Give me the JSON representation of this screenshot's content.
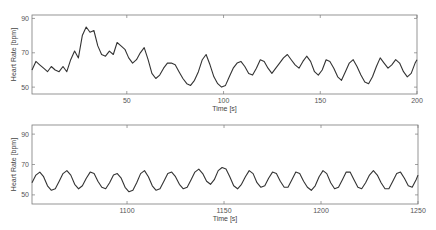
{
  "chart_data": [
    {
      "type": "line",
      "title": "",
      "xlabel": "Time [s]",
      "ylabel": "Heart Rate [bpm]",
      "xlim": [
        1,
        200
      ],
      "ylim": [
        46,
        92
      ],
      "xticks": [
        50,
        100,
        150,
        200
      ],
      "yticks": [
        50,
        70,
        90
      ],
      "grid": false,
      "legend": null,
      "line_color": "#333333",
      "series": [
        {
          "name": "Heart Rate",
          "x": [
            1,
            3,
            5,
            7,
            9,
            11,
            13,
            15,
            17,
            19,
            21,
            23,
            25,
            27,
            29,
            31,
            33,
            35,
            37,
            39,
            41,
            43,
            45,
            47,
            49,
            51,
            53,
            55,
            57,
            59,
            61,
            63,
            65,
            67,
            69,
            71,
            73,
            75,
            77,
            79,
            81,
            83,
            85,
            87,
            89,
            91,
            93,
            95,
            97,
            99,
            101,
            103,
            105,
            107,
            109,
            111,
            113,
            115,
            117,
            119,
            121,
            123,
            125,
            127,
            129,
            131,
            133,
            135,
            137,
            139,
            141,
            143,
            145,
            147,
            149,
            151,
            153,
            155,
            157,
            159,
            161,
            163,
            165,
            167,
            169,
            171,
            173,
            175,
            177,
            179,
            181,
            183,
            185,
            187,
            189,
            191,
            193,
            195,
            197,
            199,
            200
          ],
          "y": [
            60,
            65,
            63,
            61,
            59,
            62,
            60,
            59,
            62,
            59,
            66,
            71,
            67,
            80,
            85,
            82,
            83,
            74,
            69,
            68,
            71,
            69,
            76,
            74,
            72,
            67,
            64,
            66,
            70,
            73,
            66,
            58,
            55,
            57,
            61,
            64,
            64,
            63,
            59,
            55,
            52,
            51,
            54,
            59,
            66,
            69,
            63,
            56,
            52,
            50,
            51,
            56,
            61,
            64,
            65,
            62,
            58,
            57,
            61,
            66,
            65,
            61,
            58,
            61,
            64,
            67,
            69,
            66,
            63,
            61,
            65,
            68,
            65,
            59,
            57,
            60,
            66,
            65,
            61,
            56,
            54,
            59,
            64,
            66,
            62,
            57,
            53,
            52,
            56,
            62,
            67,
            64,
            61,
            63,
            66,
            64,
            59,
            56,
            58,
            64,
            66
          ]
        }
      ]
    },
    {
      "type": "line",
      "title": "",
      "xlabel": "Time [s]",
      "ylabel": "Heart Rate [bpm]",
      "xlim": [
        1051,
        1250
      ],
      "ylim": [
        44,
        96
      ],
      "xticks": [
        1100,
        1150,
        1200,
        1250
      ],
      "yticks": [
        50,
        70,
        90
      ],
      "grid": false,
      "legend": null,
      "line_color": "#333333",
      "series": [
        {
          "name": "Heart Rate",
          "x": [
            1051,
            1053,
            1055,
            1057,
            1059,
            1061,
            1063,
            1065,
            1067,
            1069,
            1071,
            1073,
            1075,
            1077,
            1079,
            1081,
            1083,
            1085,
            1087,
            1089,
            1091,
            1093,
            1095,
            1097,
            1099,
            1101,
            1103,
            1105,
            1107,
            1109,
            1111,
            1113,
            1115,
            1117,
            1119,
            1121,
            1123,
            1125,
            1127,
            1129,
            1131,
            1133,
            1135,
            1137,
            1139,
            1141,
            1143,
            1145,
            1147,
            1149,
            1151,
            1153,
            1155,
            1157,
            1159,
            1161,
            1163,
            1165,
            1167,
            1169,
            1171,
            1173,
            1175,
            1177,
            1179,
            1181,
            1183,
            1185,
            1187,
            1189,
            1191,
            1193,
            1195,
            1197,
            1199,
            1201,
            1203,
            1205,
            1207,
            1209,
            1211,
            1213,
            1215,
            1217,
            1219,
            1221,
            1223,
            1225,
            1227,
            1229,
            1231,
            1233,
            1235,
            1237,
            1239,
            1241,
            1243,
            1245,
            1247,
            1249,
            1250
          ],
          "y": [
            58,
            63,
            65,
            62,
            56,
            53,
            54,
            59,
            64,
            66,
            63,
            57,
            54,
            56,
            61,
            65,
            64,
            59,
            55,
            54,
            58,
            63,
            64,
            61,
            55,
            52,
            53,
            58,
            64,
            66,
            62,
            56,
            53,
            54,
            59,
            64,
            65,
            62,
            57,
            54,
            55,
            60,
            65,
            67,
            64,
            59,
            57,
            60,
            66,
            68,
            67,
            62,
            56,
            54,
            57,
            62,
            66,
            64,
            58,
            55,
            56,
            61,
            65,
            64,
            59,
            55,
            55,
            60,
            65,
            64,
            59,
            55,
            53,
            56,
            62,
            66,
            64,
            58,
            54,
            55,
            60,
            65,
            65,
            60,
            55,
            54,
            58,
            63,
            66,
            63,
            58,
            54,
            54,
            59,
            64,
            65,
            61,
            56,
            55,
            60,
            63
          ]
        }
      ]
    }
  ]
}
